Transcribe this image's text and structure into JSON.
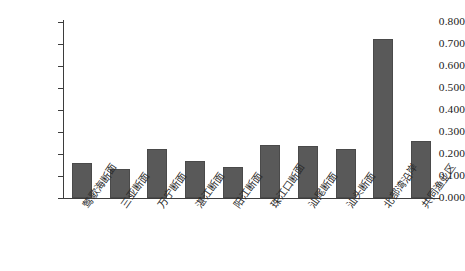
{
  "chart_data": {
    "type": "bar",
    "title": "",
    "subtitle": "",
    "xlabel": "",
    "ylabel": "",
    "ylim": [
      0.0,
      0.8
    ],
    "grid": false,
    "legend": null,
    "bar_color": "#595959",
    "axis_color": "#3d3d3d",
    "categories": [
      "莺歌海断面",
      "三亚断面",
      "万宁断面",
      "湛江断面",
      "阳江断面",
      "珠江口断面",
      "汕尾断面",
      "汕头断面",
      "北部湾沿岸",
      "共同渔业区"
    ],
    "values": [
      0.155,
      0.13,
      0.22,
      0.165,
      0.14,
      0.24,
      0.235,
      0.22,
      0.72,
      0.258
    ],
    "y_ticks": [
      0.0,
      0.1,
      0.2,
      0.3,
      0.4,
      0.5,
      0.6,
      0.7,
      0.8
    ],
    "y_tick_labels": [
      "0.000",
      "0.100",
      "0.200",
      "0.300",
      "0.400",
      "0.500",
      "0.600",
      "0.700",
      "0.800"
    ]
  }
}
